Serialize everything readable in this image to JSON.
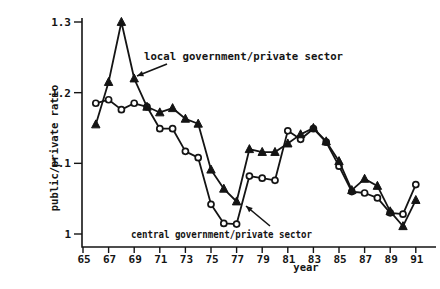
{
  "figure_title": "",
  "chart_data": {
    "type": "line",
    "title": "",
    "xlabel": "year",
    "ylabel": "public/private ratio",
    "xlim": [
      65,
      92
    ],
    "ylim": [
      1.0,
      1.3
    ],
    "grid": false,
    "legend_position": "none (inline arrow annotations)",
    "x_ticks": [
      65,
      67,
      69,
      71,
      73,
      75,
      77,
      79,
      81,
      83,
      85,
      87,
      89,
      91
    ],
    "x_tick_labels": [
      "65",
      "67",
      "69",
      "71",
      "73",
      "75",
      "77",
      "79",
      "81",
      "83",
      "85",
      "87",
      "89",
      "91"
    ],
    "y_ticks": [
      1.0,
      1.1,
      1.2,
      1.3
    ],
    "y_tick_labels": [
      "1",
      "1.1",
      "1.2",
      "1.3"
    ],
    "x": [
      66,
      67,
      68,
      69,
      70,
      71,
      72,
      73,
      74,
      75,
      76,
      77,
      78,
      79,
      80,
      81,
      82,
      83,
      84,
      85,
      86,
      87,
      88,
      89,
      90,
      91
    ],
    "series": [
      {
        "name": "central government/private sector",
        "marker": "open-circle",
        "color": "#141414",
        "values": [
          1.185,
          1.19,
          1.176,
          1.185,
          1.18,
          1.149,
          1.149,
          1.117,
          1.108,
          1.042,
          1.015,
          1.014,
          1.082,
          1.079,
          1.076,
          1.146,
          1.134,
          1.149,
          1.13,
          1.096,
          1.06,
          1.058,
          1.051,
          1.03,
          1.028,
          1.07
        ]
      },
      {
        "name": "local government/private sector",
        "marker": "filled-triangle",
        "color": "#141414",
        "values": [
          1.155,
          1.215,
          1.3,
          1.22,
          1.18,
          1.172,
          1.178,
          1.163,
          1.156,
          1.091,
          1.064,
          1.046,
          1.12,
          1.116,
          1.116,
          1.128,
          1.141,
          1.15,
          1.131,
          1.103,
          1.062,
          1.078,
          1.068,
          1.032,
          1.011,
          1.048
        ]
      }
    ],
    "annotations": [
      {
        "text": "local government/private sector",
        "points_to": "triangle series near its 1968 peak"
      },
      {
        "text": "central government/private sector",
        "points_to": "circle series rise after 1977 trough"
      }
    ]
  },
  "colors": {
    "ink": "#141414",
    "background": "#ffffff"
  }
}
